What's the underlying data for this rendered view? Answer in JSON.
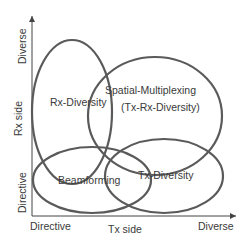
{
  "axes": {
    "x_title": "Tx side",
    "x_low": "Directive",
    "x_high": "Diverse",
    "y_title": "Rx side",
    "y_low": "Directive",
    "y_high": "Diverse"
  },
  "regions": [
    {
      "label": "Rx-Diversity",
      "cx": 72,
      "cy": 112,
      "rx": 40,
      "ry": 72
    },
    {
      "label": "Spatial-Multiplexing",
      "sublabel": "(Tx-Rx-Diversity)",
      "cx": 155,
      "cy": 116,
      "rx": 67,
      "ry": 59
    },
    {
      "label": "Beamforming",
      "cx": 92,
      "cy": 180,
      "rx": 59,
      "ry": 33
    },
    {
      "label": "Tx-Diversity",
      "cx": 164,
      "cy": 176,
      "rx": 59,
      "ry": 37
    }
  ],
  "colors": {
    "ellipse_stroke": "#5a5a5a",
    "axis": "#444444",
    "text": "#3a3a3a"
  }
}
